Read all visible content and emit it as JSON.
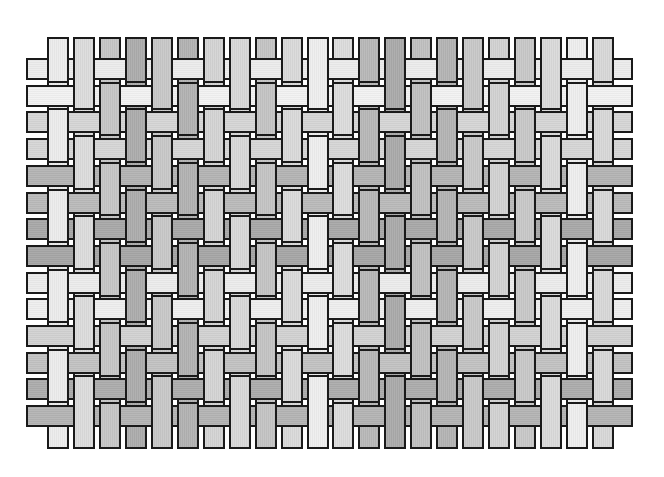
{
  "figure": {
    "title": "",
    "weave": "1/2 twill",
    "rule": "weft visible where (col - row) mod 3 == 2; otherwise warp visible",
    "background": "#ffffff",
    "border_color": "#1a1a1a"
  },
  "geometry": {
    "columns": 22,
    "rows": 14,
    "col_start_x": 47,
    "col_pitch": 25.95,
    "strand_width": 22,
    "row_start_y": 58,
    "row_pitch": 26.7,
    "strand_height": 22,
    "warp_top": 37,
    "warp_bottom": 449,
    "weft_left": 26,
    "weft_right": 633,
    "overhang": 3
  },
  "warp_colors": [
    "#ececec",
    "#dcdcdc",
    "#c6c6c6",
    "#acacac",
    "#c8c8c8",
    "#b2b2b2",
    "#d4d4d4",
    "#d8d8d8",
    "#c4c4c4",
    "#dadada",
    "#eeeeee",
    "#dcdcdc",
    "#b8b8b8",
    "#aaaaaa",
    "#c0c0c0",
    "#b4b4b4",
    "#c8c8c8",
    "#d2d2d2",
    "#c8c8c8",
    "#dadada",
    "#eeeeee",
    "#d8d8d8"
  ],
  "weft_colors": [
    "#ececec",
    "#f2f2f2",
    "#d6d6d6",
    "#d6d6d6",
    "#b4b4b4",
    "#bababa",
    "#a8a8a8",
    "#a6a6a6",
    "#ececec",
    "#eeeeee",
    "#d2d2d2",
    "#c2c2c2",
    "#acacac",
    "#b4b4b4"
  ]
}
